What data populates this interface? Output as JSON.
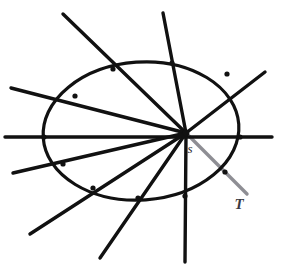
{
  "figure": {
    "background_color": "#ffffff",
    "width": 283,
    "height": 271,
    "conic": {
      "name": "ellipse",
      "stroke_color": "#111111",
      "stroke_width": 3.2,
      "center_x": 141,
      "center_y": 131,
      "radius_x": 98,
      "radius_y": 69,
      "rotation_deg": -4
    },
    "pencil_point": {
      "label": "s",
      "x": 186,
      "y": 133,
      "label_x": 190,
      "label_y": 153,
      "dot_radius": 3.4,
      "color": "#111111"
    },
    "tangent": {
      "label": "T",
      "label_x": 239,
      "label_y": 209,
      "stroke_color": "#8e8e94",
      "stroke_width": 3.4,
      "from_x": 186,
      "from_y": 133,
      "to_x": 247,
      "to_y": 194
    },
    "secant_lines": [
      {
        "name": "secant-upper-left-steep",
        "x1": 63,
        "y1": 14,
        "x2": 186,
        "y2": 133,
        "stroke_width": 3.4
      },
      {
        "name": "secant-top-vertical",
        "x1": 163,
        "y1": 13,
        "x2": 186,
        "y2": 133,
        "stroke_width": 3.4
      },
      {
        "name": "secant-upper-right",
        "x1": 265,
        "y1": 72,
        "x2": 186,
        "y2": 133,
        "stroke_width": 3.4
      },
      {
        "name": "secant-left-upper",
        "x1": 11,
        "y1": 88,
        "x2": 186,
        "y2": 133,
        "stroke_width": 3.4
      },
      {
        "name": "secant-horizontal",
        "x1": 5,
        "y1": 137,
        "x2": 272,
        "y2": 137,
        "stroke_width": 3.4
      },
      {
        "name": "secant-left-lower",
        "x1": 13,
        "y1": 173,
        "x2": 186,
        "y2": 133,
        "stroke_width": 3.4
      },
      {
        "name": "secant-lower-left-flat",
        "x1": 30,
        "y1": 234,
        "x2": 186,
        "y2": 133,
        "stroke_width": 3.4
      },
      {
        "name": "secant-lower-left-steep",
        "x1": 100,
        "y1": 258,
        "x2": 186,
        "y2": 133,
        "stroke_width": 3.4
      },
      {
        "name": "secant-vertical",
        "x1": 185,
        "y1": 262,
        "x2": 186,
        "y2": 133,
        "stroke_width": 3.4
      }
    ],
    "intersection_nodes": [
      {
        "name": "node-top-left",
        "x": 113,
        "y": 69
      },
      {
        "name": "node-top",
        "x": 172,
        "y": 63
      },
      {
        "name": "node-upper-right",
        "x": 227,
        "y": 74
      },
      {
        "name": "node-left-upper",
        "x": 75,
        "y": 96
      },
      {
        "name": "node-left-mid",
        "x": 44,
        "y": 137
      },
      {
        "name": "node-right-mid",
        "x": 240,
        "y": 137
      },
      {
        "name": "node-left-lower",
        "x": 63,
        "y": 164
      },
      {
        "name": "node-lower-left",
        "x": 93,
        "y": 188
      },
      {
        "name": "node-bottom",
        "x": 138,
        "y": 198
      },
      {
        "name": "node-bottom-right",
        "x": 185,
        "y": 196
      },
      {
        "name": "node-tangent-cross",
        "x": 225,
        "y": 172
      }
    ]
  }
}
